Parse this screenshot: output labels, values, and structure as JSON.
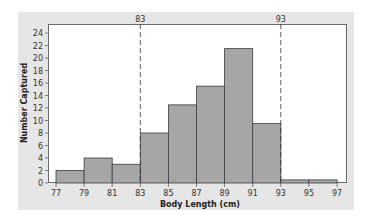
{
  "chart_data": {
    "type": "bar",
    "subtype": "histogram",
    "title": "",
    "xlabel": "Body Length (cm)",
    "ylabel": "Number Captured",
    "bin_edges": [
      77,
      79,
      81,
      83,
      85,
      87,
      89,
      91,
      93,
      95,
      97
    ],
    "categories": [
      "77-79",
      "79-81",
      "81-83",
      "83-85",
      "85-87",
      "87-89",
      "89-91",
      "91-93",
      "93-95",
      "95-97"
    ],
    "values": [
      2,
      4,
      3,
      8,
      12.5,
      15.5,
      21.5,
      9.5,
      0.5,
      0.5
    ],
    "xticks": [
      77,
      79,
      81,
      83,
      85,
      87,
      89,
      91,
      93,
      95,
      97
    ],
    "yticks": [
      0,
      2,
      4,
      6,
      8,
      10,
      12,
      14,
      16,
      18,
      20,
      22,
      24
    ],
    "xlim": [
      76.4,
      97.7
    ],
    "ylim": [
      0,
      25.4
    ],
    "grid": false,
    "reference_lines": [
      {
        "x": 83,
        "label": "83",
        "style": "dashed"
      },
      {
        "x": 93,
        "label": "93",
        "style": "dashed"
      }
    ],
    "colors": {
      "bar_fill": "#a6a6a6",
      "bar_edge": "#3c3c3c",
      "panel_bg": "#e6e6e6",
      "plot_bg": "#ffffff"
    }
  }
}
